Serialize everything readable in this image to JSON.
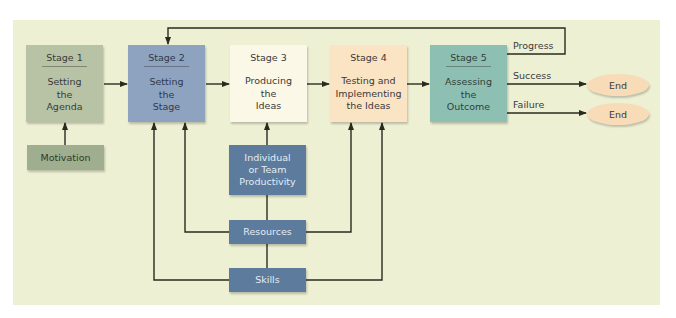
{
  "diagram": {
    "stages": [
      {
        "title": "Stage 1",
        "description": "Setting\nthe\nAgenda",
        "color": "#b8c3a6"
      },
      {
        "title": "Stage 2",
        "description": "Setting\nthe\nStage",
        "color": "#8ea3c0"
      },
      {
        "title": "Stage 3",
        "description": "Producing\nthe\nIdeas",
        "color": "#fcf8e8"
      },
      {
        "title": "Stage 4",
        "description": "Testing and\nImplementing\nthe Ideas",
        "color": "#fbe4c3"
      },
      {
        "title": "Stage 5",
        "description": "Assessing\nthe\nOutcome",
        "color": "#8ebfb3"
      }
    ],
    "factors": {
      "motivation": "Motivation",
      "individual": "Individual\nor Team\nProductivity",
      "resources": "Resources",
      "skills": "Skills"
    },
    "outcomes": {
      "progress": "Progress",
      "success": "Success",
      "failure": "Failure",
      "end_success": "End",
      "end_failure": "End"
    },
    "colors": {
      "panel": "#eef0d4",
      "factor_blue": "#5d7b9d",
      "motivation": "#9fae8e",
      "end": "#f8dcb8",
      "line": "#2a2a1e"
    }
  }
}
